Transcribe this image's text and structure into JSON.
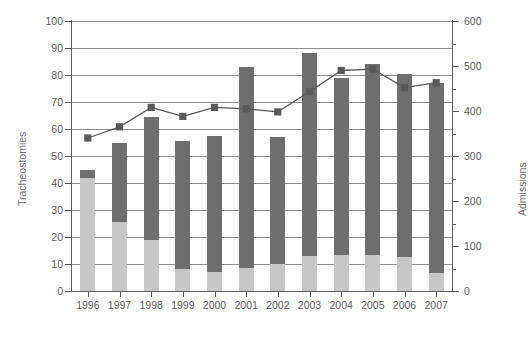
{
  "chart_data": {
    "type": "bar",
    "title": "",
    "subtitle": "",
    "categories": [
      "1996",
      "1997",
      "1998",
      "1999",
      "2000",
      "2001",
      "2002",
      "2003",
      "2004",
      "2005",
      "2006",
      "2007"
    ],
    "xlabel": "",
    "ylabel": "Tracheostomies",
    "ylabel_secondary": "Admissions",
    "ylim": [
      0,
      100
    ],
    "ylim_secondary": [
      0,
      600
    ],
    "ytick_labels": [
      "0",
      "10",
      "20",
      "30",
      "40",
      "50",
      "60",
      "70",
      "80",
      "90",
      "100"
    ],
    "ytick_values": [
      0,
      10,
      20,
      30,
      40,
      50,
      60,
      70,
      80,
      90,
      100
    ],
    "ytick_labels_secondary": [
      "0",
      "100",
      "200",
      "300",
      "400",
      "500",
      "600"
    ],
    "ytick_values_secondary": [
      0,
      100,
      200,
      300,
      400,
      500,
      600
    ],
    "ytick_minor_secondary": [
      50,
      150,
      250,
      350,
      450,
      550
    ],
    "grid": true,
    "grid_axis": "y",
    "legend": "none",
    "stacked": true,
    "series": [
      {
        "name": "Tracheostomies (lower segment)",
        "axis": "left",
        "type": "bar",
        "color": "#c6c6c6",
        "values": [
          42,
          25.5,
          19,
          8,
          7,
          8.5,
          10,
          13,
          13.5,
          13.5,
          12.5,
          6.5
        ]
      },
      {
        "name": "Tracheostomies (upper segment)",
        "axis": "left",
        "type": "bar",
        "color": "#6e6e6e",
        "values": [
          3,
          29.5,
          45.5,
          47.5,
          50.5,
          74.5,
          47,
          75,
          65.5,
          70.5,
          68,
          70.5
        ]
      },
      {
        "name": "Tracheostomies (total)",
        "axis": "left",
        "type": "bar-total",
        "values": [
          45,
          55,
          64.5,
          55.5,
          57.5,
          83,
          57,
          88,
          79,
          84,
          80.5,
          77
        ]
      },
      {
        "name": "Admissions",
        "axis": "right",
        "type": "line",
        "color": "#5a5a5a",
        "marker": "square",
        "values": [
          340,
          365,
          408,
          388,
          408,
          405,
          398,
          443,
          490,
          493,
          452,
          463
        ]
      }
    ]
  },
  "colors": {
    "bar_light": "#c6c6c6",
    "bar_dark": "#6e6e6e",
    "line": "#5a5a5a",
    "grid": "#8d8d8d",
    "axis": "#5d5d5d",
    "text": "#5b5b5b",
    "background": "#ffffff"
  }
}
